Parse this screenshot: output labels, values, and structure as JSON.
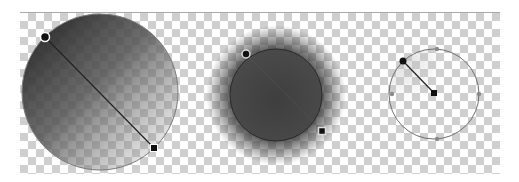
{
  "colors": {
    "dark": "#3a3a3a",
    "mid": "#5a5a5a",
    "outline": "#7a7a7a",
    "handle": "#111111",
    "handle_ring": "#ffffff"
  },
  "examples": [
    {
      "id": "linear",
      "label": "Linear gradient fill",
      "handles": [
        "start-handle",
        "end-handle"
      ]
    },
    {
      "id": "glow",
      "label": "Radial fill with soft glow",
      "handles": [
        "start-handle",
        "end-handle"
      ]
    },
    {
      "id": "radial-outline",
      "label": "Radial gradient outline",
      "handles": [
        "start-handle",
        "center-handle"
      ]
    }
  ]
}
